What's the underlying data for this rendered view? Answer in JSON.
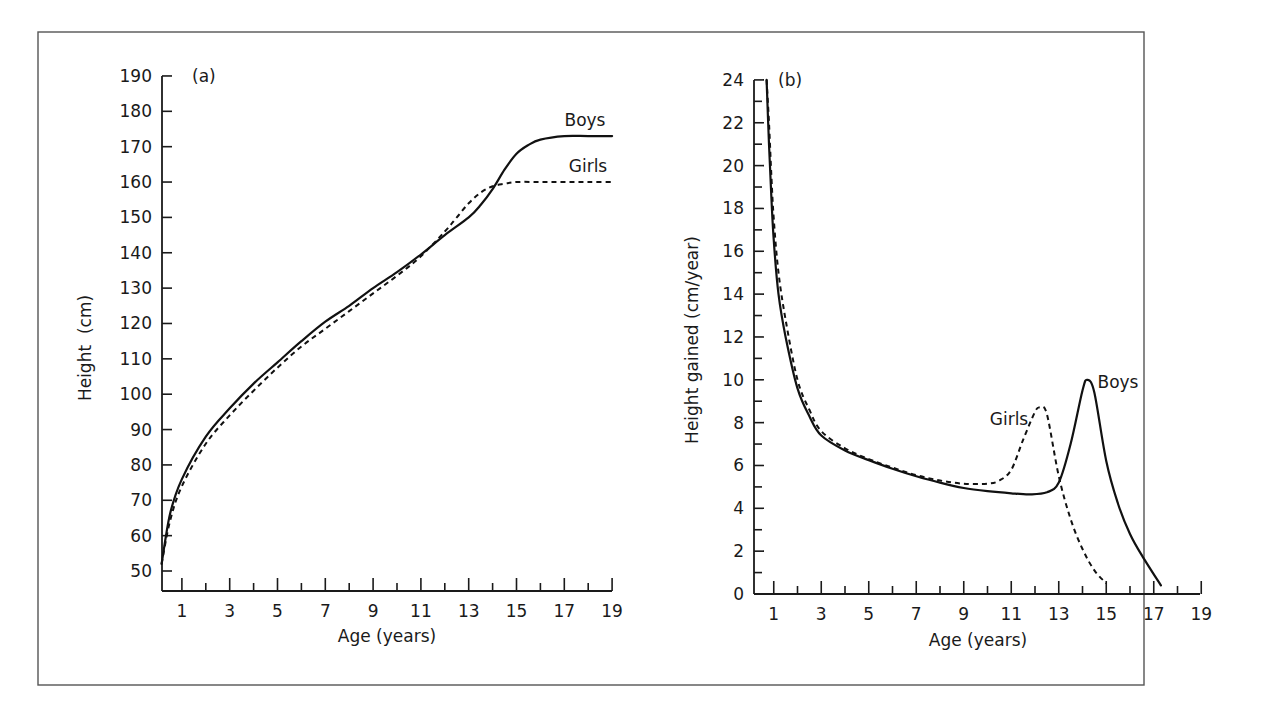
{
  "figure": {
    "panel_a_label": "(a)",
    "panel_b_label": "(b)"
  },
  "chart_data": [
    {
      "type": "line",
      "panel": "(a)",
      "title": "",
      "xlabel": "Age (years)",
      "ylabel": "Height  (cm)",
      "xlim": [
        0,
        19
      ],
      "ylim": [
        50,
        190
      ],
      "grid": false,
      "legend": "inline labels at right end of lines",
      "x_ticks": [
        1,
        3,
        5,
        7,
        9,
        11,
        13,
        15,
        17,
        19
      ],
      "y_ticks": [
        50,
        60,
        70,
        80,
        90,
        100,
        110,
        120,
        130,
        140,
        150,
        160,
        170,
        180,
        190
      ],
      "series": [
        {
          "name": "Boys",
          "style": "solid",
          "x": [
            0.15,
            0.5,
            1,
            2,
            3,
            4,
            5,
            6,
            7,
            8,
            9,
            10,
            11,
            12,
            13,
            13.5,
            14,
            14.5,
            15,
            15.5,
            16,
            17,
            18,
            19
          ],
          "y": [
            52,
            66,
            76,
            88,
            96,
            103,
            109,
            115,
            120.5,
            125,
            130,
            134.5,
            139.5,
            145,
            150,
            153.5,
            158,
            163.5,
            168,
            170.5,
            172,
            173,
            173,
            173
          ]
        },
        {
          "name": "Girls",
          "style": "dashed",
          "x": [
            0.15,
            0.5,
            1,
            2,
            3,
            4,
            5,
            6,
            7,
            8,
            9,
            10,
            11,
            12,
            12.5,
            13,
            13.5,
            14,
            14.5,
            15,
            16,
            17,
            18,
            19
          ],
          "y": [
            52,
            64,
            74,
            86,
            94,
            101,
            107.5,
            113.5,
            118.5,
            123.5,
            128.5,
            133.5,
            139,
            146,
            150,
            154,
            157,
            158.8,
            159.5,
            160,
            160,
            160,
            160,
            160
          ]
        }
      ],
      "annotations": [
        "Boys",
        "Girls"
      ]
    },
    {
      "type": "line",
      "panel": "(b)",
      "title": "",
      "xlabel": "Age (years)",
      "ylabel": "Height gained (cm/year)",
      "xlim": [
        0,
        19
      ],
      "ylim": [
        0,
        24
      ],
      "grid": false,
      "legend": "inline labels near peaks",
      "x_ticks": [
        1,
        3,
        5,
        7,
        9,
        11,
        13,
        15,
        17,
        19
      ],
      "y_ticks": [
        0,
        2,
        4,
        6,
        8,
        10,
        12,
        14,
        16,
        18,
        20,
        22,
        24
      ],
      "series": [
        {
          "name": "Boys",
          "style": "solid",
          "x": [
            0.7,
            0.8,
            0.9,
            1.0,
            1.2,
            1.5,
            2,
            2.5,
            3,
            4,
            5,
            6,
            7,
            8,
            9,
            10,
            11,
            11.8,
            12.5,
            13,
            13.5,
            14,
            14.2,
            14.5,
            15,
            15.5,
            16,
            16.5,
            17.3
          ],
          "y": [
            24,
            21,
            18.5,
            16.5,
            14,
            12,
            9.6,
            8.3,
            7.4,
            6.7,
            6.25,
            5.85,
            5.5,
            5.2,
            4.95,
            4.8,
            4.7,
            4.65,
            4.75,
            5.2,
            7,
            9.5,
            10,
            9.4,
            6.2,
            4.2,
            2.8,
            1.8,
            0.4
          ]
        },
        {
          "name": "Girls",
          "style": "dashed",
          "x": [
            0.7,
            0.8,
            0.9,
            1.0,
            1.2,
            1.5,
            2,
            2.5,
            3,
            4,
            5,
            6,
            7,
            8,
            9,
            10,
            10.5,
            11,
            11.5,
            12,
            12.2,
            12.5,
            13,
            13.5,
            14,
            14.5,
            15
          ],
          "y": [
            24,
            22,
            19.5,
            17.5,
            15,
            12.8,
            10,
            8.6,
            7.6,
            6.8,
            6.3,
            5.9,
            5.55,
            5.3,
            5.15,
            5.15,
            5.3,
            5.8,
            7.2,
            8.5,
            8.7,
            8.4,
            5.5,
            3.5,
            2.1,
            1.1,
            0.5
          ]
        }
      ],
      "annotations": [
        "Boys",
        "Girls"
      ]
    }
  ]
}
